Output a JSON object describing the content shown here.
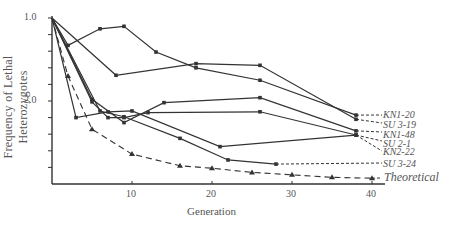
{
  "chart_data": {
    "type": "line",
    "title": "",
    "xlabel": "Generation",
    "ylabel": "Frequency of Lethal Heterozygotes",
    "xlim": [
      0,
      42
    ],
    "ylim": [
      1.0,
      3.0
    ],
    "y_inverted": true,
    "grid": false,
    "x_ticks": [
      10,
      20,
      30,
      40
    ],
    "x_tick_labels": [
      "10",
      "20",
      "30",
      "40"
    ],
    "y_tick_labels": [
      "1.0",
      "2.0"
    ],
    "y_tick_values": [
      1.0,
      2.0
    ],
    "y_minor_step": 0.2,
    "legend_position": "right, inline labels",
    "series": [
      {
        "name": "KN1-20",
        "style": "solid",
        "x": [
          0,
          2,
          6,
          9,
          13,
          18,
          26,
          38
        ],
        "values": [
          1.0,
          1.33,
          1.13,
          1.1,
          1.41,
          1.6,
          1.75,
          2.17
        ]
      },
      {
        "name": "SU 3-19",
        "style": "solid",
        "x": [
          0,
          8,
          18,
          26,
          38
        ],
        "values": [
          1.0,
          1.69,
          1.55,
          1.57,
          2.22
        ]
      },
      {
        "name": "KN1-48",
        "style": "solid",
        "x": [
          0,
          5,
          9,
          14,
          26,
          38
        ],
        "values": [
          1.0,
          1.98,
          2.26,
          2.02,
          1.96,
          2.36
        ]
      },
      {
        "name": "SU 2-1",
        "style": "solid",
        "x": [
          0,
          5,
          7,
          9,
          12,
          26,
          38
        ],
        "values": [
          1.0,
          2.01,
          2.2,
          2.2,
          2.14,
          2.13,
          2.41
        ]
      },
      {
        "name": "KN2-22",
        "style": "solid",
        "x": [
          0,
          3,
          7,
          10,
          21,
          38
        ],
        "values": [
          1.0,
          2.2,
          2.13,
          2.12,
          2.55,
          2.41
        ]
      },
      {
        "name": "SU 3-24",
        "style": "solid",
        "x": [
          0,
          6,
          9,
          16,
          22,
          28
        ],
        "values": [
          1.0,
          2.12,
          2.19,
          2.45,
          2.71,
          2.76
        ]
      },
      {
        "name": "Theoretical",
        "style": "dashed",
        "x": [
          0,
          2,
          5,
          10,
          16,
          20,
          25,
          30,
          35,
          40
        ],
        "values": [
          1.0,
          1.7,
          2.34,
          2.64,
          2.78,
          2.81,
          2.86,
          2.89,
          2.92,
          2.93
        ]
      }
    ]
  },
  "labels": {
    "ylabel": "Frequency of Lethal Heterozygotes",
    "xlabel": "Generation",
    "y_ticks": [
      "1.0",
      "2.0"
    ],
    "x_ticks": [
      "10",
      "20",
      "30",
      "40"
    ],
    "series": [
      "KN1-20",
      "SU 3-19",
      "KN1-48",
      "SU 2-1",
      "KN2-22",
      "SU 3-24",
      "Theoretical"
    ]
  }
}
